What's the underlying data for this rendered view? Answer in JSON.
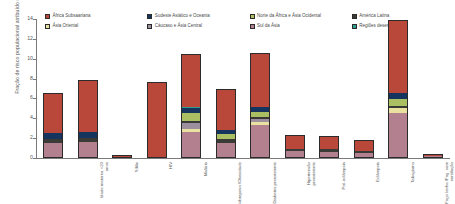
{
  "chart_data": {
    "type": "bar",
    "subtype": "stacked-bar",
    "title": "",
    "xlabel": "",
    "ylabel": "Fração de risco populacional atribuído (%)",
    "ylim": [
      0,
      14
    ],
    "yticks": [
      0,
      2,
      4,
      6,
      8,
      10,
      12,
      14
    ],
    "grid": false,
    "legend_position": "top",
    "categories": [
      "Idade materna <20 anos",
      "Sífilis",
      "HIV",
      "Malária",
      "Sobrepeso /Obesidade",
      "Diabetes preexistente",
      "Hipertensão preexistente",
      "Pré-eclâmpsia",
      "Eclâmpsia",
      "Tabagismo",
      "Fogo lenha /Fog. sem ventilação",
      "Anticoncepcionais"
    ],
    "series": [
      {
        "name": "Sul da Ásia",
        "color": "#b3808f",
        "values": [
          1.55,
          1.65,
          0.12,
          0.1,
          2.6,
          1.55,
          3.3,
          0.7,
          0.6,
          0.5,
          4.55,
          0.18
        ]
      },
      {
        "name": "Ásia Oriental",
        "color": "#e9e1a0",
        "values": [
          0.0,
          0.0,
          0.0,
          0.0,
          0.35,
          0.0,
          0.35,
          0.0,
          0.0,
          0.0,
          0.45,
          0.0
        ]
      },
      {
        "name": "Cáucaso e Ásia Central",
        "color": "#9e8f9e",
        "values": [
          0.0,
          0.0,
          0.0,
          0.0,
          0.55,
          0.0,
          0.25,
          0.0,
          0.0,
          0.0,
          0.0,
          0.0
        ]
      },
      {
        "name": "América Latina",
        "color": "#3a3a36",
        "values": [
          0.38,
          0.4,
          0.0,
          0.0,
          0.22,
          0.4,
          0.22,
          0.25,
          0.28,
          0.22,
          0.25,
          0.05
        ]
      },
      {
        "name": "Norte da África e Ásia Ocidental",
        "color": "#aac063",
        "values": [
          0.0,
          0.0,
          0.0,
          0.0,
          0.85,
          0.45,
          0.55,
          0.0,
          0.0,
          0.0,
          0.7,
          0.0
        ]
      },
      {
        "name": "Sudeste Asiático e Oceania",
        "color": "#15355e",
        "values": [
          0.55,
          0.6,
          0.0,
          0.0,
          0.5,
          0.4,
          0.5,
          0.0,
          0.0,
          0.0,
          0.6,
          0.0
        ]
      },
      {
        "name": "Regiões desenvolvidas",
        "color": "#2f9e8f",
        "values": [
          0.0,
          0.0,
          0.0,
          0.0,
          0.1,
          0.0,
          0.0,
          0.0,
          0.0,
          0.0,
          0.0,
          0.0
        ]
      },
      {
        "name": "África Subsaariana",
        "color": "#b9483a",
        "values": [
          4.05,
          5.2,
          0.18,
          7.55,
          5.35,
          4.15,
          5.45,
          1.35,
          1.3,
          1.05,
          7.4,
          0.2
        ]
      }
    ],
    "legend_order": [
      "África Subsaariana",
      "Sudeste Asiático e Oceania",
      "Norte da África e Ásia Ocidental",
      "América Latina",
      "Ásia Oriental",
      "Cáucaso e Ásia Central",
      "Sul da Ásia",
      "Regiões desenvolvidas"
    ]
  },
  "legend": {
    "items": [
      {
        "label": "África Subsaariana",
        "color": "#b9483a"
      },
      {
        "label": "Sudeste Asiático e Oceania",
        "color": "#15355e"
      },
      {
        "label": "Norte da África e Ásia Ocidental",
        "color": "#aac063"
      },
      {
        "label": "América Latina",
        "color": "#3a3a36"
      },
      {
        "label": "Ásia Oriental",
        "color": "#e9e1a0"
      },
      {
        "label": "Cáucaso e Ásia Central",
        "color": "#9e8f9e"
      },
      {
        "label": "Sul da Ásia",
        "color": "#b3808f"
      },
      {
        "label": "Regiões desenvolvidas",
        "color": "#2f9e8f"
      }
    ]
  },
  "axes": {
    "y_title": "Fração de risco populacional atribuído (%)",
    "y_ticks": [
      "0",
      "2",
      "4",
      "6",
      "8",
      "10",
      "12",
      "14"
    ],
    "x_labels": [
      "Idade materna <20 anos",
      "Sífilis",
      "HIV",
      "Malária",
      "Sobrepeso /Obesidade",
      "Diabetes preexistente",
      "Hipertensão preexistente",
      "Pré-eclâmpsia",
      "Eclâmpsia",
      "Tabagismo",
      "Fogo lenha /Fog. sem ventilação",
      "Anticoncepcionais"
    ]
  },
  "colors": {
    "axis": "#7a7a7a",
    "text": "#5a5a5a",
    "outline": "#2b2b2b",
    "background": "#ffffff"
  }
}
